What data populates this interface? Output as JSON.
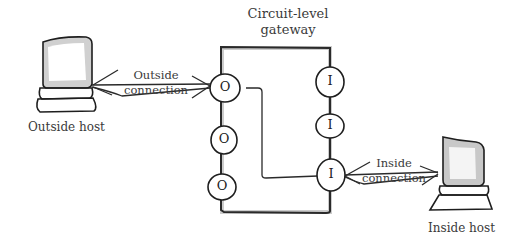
{
  "diagram": {
    "gateway": {
      "title": "Circuit-level gateway",
      "title_line1": "Circuit-level",
      "title_line2": "gateway"
    },
    "outside_host": {
      "label": "Outside host"
    },
    "inside_host": {
      "label": "Inside host"
    },
    "outside_connection": {
      "line1": "Outside",
      "line2": "connection"
    },
    "inside_connection": {
      "line1": "Inside",
      "line2": "connection"
    },
    "outside_ports": [
      {
        "letter": "O"
      },
      {
        "letter": "O"
      },
      {
        "letter": "O"
      }
    ],
    "inside_ports": [
      {
        "letter": "I"
      },
      {
        "letter": "I"
      },
      {
        "letter": "I"
      }
    ],
    "colors": {
      "stroke": "#2a2a2a",
      "box_shadow": "#9a9a9a",
      "background": "#ffffff"
    }
  }
}
